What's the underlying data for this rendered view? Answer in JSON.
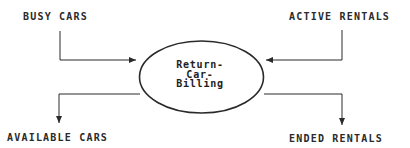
{
  "diagram": {
    "type": "data-flow-diagram",
    "process": {
      "name": "Return-Car-Billing",
      "lines": [
        "Return-",
        "Car-",
        "Billing"
      ]
    },
    "inputs": [
      {
        "label": "BUSY CARS",
        "direction": "into-process"
      },
      {
        "label": "ACTIVE RENTALS",
        "direction": "into-process"
      }
    ],
    "outputs": [
      {
        "label": "AVAILABLE CARS",
        "direction": "out-of-process"
      },
      {
        "label": "ENDED RENTALS",
        "direction": "out-of-process"
      }
    ],
    "colors": {
      "line": "#2a2a2a",
      "background": "#ffffff"
    }
  }
}
